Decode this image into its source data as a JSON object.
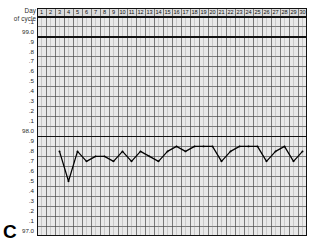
{
  "panel": {
    "letter": "C"
  },
  "header": {
    "corner_line1": "Day",
    "corner_line2": "of cycle"
  },
  "chart_data": {
    "type": "line",
    "title": "",
    "subtitle": "",
    "xlabel": "Day of cycle",
    "ylabel": "",
    "grid": true,
    "legend": null,
    "xlim": [
      1,
      30
    ],
    "ylim": [
      97.0,
      99.1
    ],
    "x": [
      1,
      2,
      3,
      4,
      5,
      6,
      7,
      8,
      9,
      10,
      11,
      12,
      13,
      14,
      15,
      16,
      17,
      18,
      19,
      20,
      21,
      22,
      23,
      24,
      25,
      26,
      27,
      28,
      29,
      30
    ],
    "categories": [
      "1",
      "2",
      "3",
      "4",
      "5",
      "6",
      "7",
      "8",
      "9",
      "10",
      "11",
      "12",
      "13",
      "14",
      "15",
      "16",
      "17",
      "18",
      "19",
      "20",
      "21",
      "22",
      "23",
      "24",
      "25",
      "26",
      "27",
      "28",
      "29",
      "30"
    ],
    "ytick_labels": [
      ".1",
      "99.0",
      ".9",
      ".8",
      ".7",
      ".6",
      ".5",
      ".4",
      ".3",
      ".2",
      ".1",
      "98.0",
      ".9",
      ".8",
      ".7",
      ".6",
      ".5",
      ".4",
      ".3",
      ".2",
      ".1",
      "97.0"
    ],
    "ytick_values": [
      99.1,
      99.0,
      98.9,
      98.8,
      98.7,
      98.6,
      98.5,
      98.4,
      98.3,
      98.2,
      98.1,
      98.0,
      97.9,
      97.8,
      97.7,
      97.6,
      97.5,
      97.4,
      97.3,
      97.2,
      97.1,
      97.0
    ],
    "major_gridlines": [
      99.0,
      98.0,
      97.0
    ],
    "series": [
      {
        "name": "Basal body temperature",
        "color": "#000000",
        "marker": "dot",
        "x": [
          3,
          4,
          5,
          6,
          7,
          8,
          9,
          10,
          11,
          12,
          13,
          14,
          15,
          16,
          17,
          18,
          19,
          20,
          21,
          22,
          23,
          24,
          25,
          26,
          27,
          28,
          29,
          30
        ],
        "values": [
          97.8,
          97.5,
          97.8,
          97.7,
          97.75,
          97.75,
          97.7,
          97.8,
          97.7,
          97.8,
          97.75,
          97.7,
          97.8,
          97.85,
          97.8,
          97.85,
          97.85,
          97.85,
          97.7,
          97.8,
          97.85,
          97.85,
          97.85,
          97.7,
          97.8,
          97.85,
          97.7,
          97.8
        ]
      }
    ]
  }
}
